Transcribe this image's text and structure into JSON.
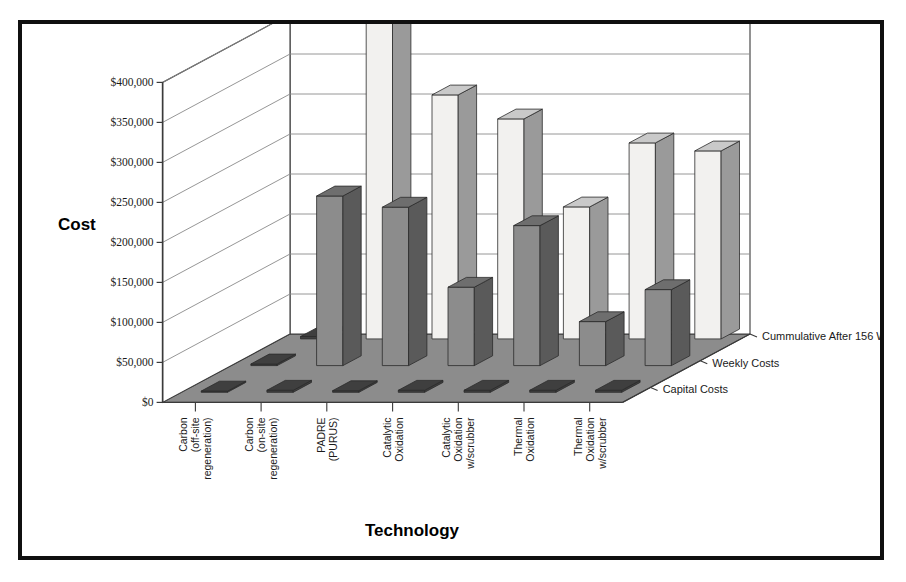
{
  "chart_data": {
    "type": "bar",
    "title": "",
    "subtitle": "",
    "xlabel": "Technology",
    "ylabel": "Cost",
    "ylim": [
      0,
      400000
    ],
    "ytick_labels": [
      "$0",
      "$50,000",
      "$100,000",
      "$150,000",
      "$200,000",
      "$250,000",
      "$300,000",
      "$350,000",
      "$400,000"
    ],
    "ytick_values": [
      0,
      50000,
      100000,
      150000,
      200000,
      250000,
      300000,
      350000,
      400000
    ],
    "grid": true,
    "legend_position": "depth-axis-right",
    "projection": "3d",
    "categories": [
      "Carbon\n(off-site\nregeneration)",
      "Carbon\n(on-site\nregeneration)",
      "PADRE\n(PURUS)",
      "Catalytic\nOxidation",
      "Catalytic\nOxidation\nw/scrubber",
      "Thermal\nOxidation",
      "Thermal\nOxidation\nw/scrubber"
    ],
    "categories_flat": [
      "Carbon (off-site regeneration)",
      "Carbon (on-site regeneration)",
      "PADRE (PURUS)",
      "Catalytic Oxidation",
      "Catalytic Oxidation w/scrubber",
      "Thermal Oxidation",
      "Thermal Oxidation w/scrubber"
    ],
    "series": [
      {
        "name": "Cummulative After 156 Weeks",
        "color": "#f2f1ef",
        "values": [
          3000,
          420000,
          305000,
          275000,
          165000,
          245000,
          235000
        ]
      },
      {
        "name": "Weekly Costs",
        "color": "#8c8c8c",
        "values": [
          2000,
          212000,
          198000,
          98000,
          175000,
          55000,
          95000
        ]
      },
      {
        "name": "Capital Costs",
        "color": "#4a4a4a",
        "values": [
          1500,
          2500,
          2000,
          2500,
          2500,
          2500,
          2500
        ]
      }
    ]
  },
  "colors": {
    "frame_border": "#101010",
    "floor": "#8c8c8c",
    "wall": "#ffffff",
    "gridline": "#8a8a8a",
    "axis_line": "#3a3a3a",
    "bar_light": "#f2f1ef",
    "bar_light_side": "#9a9a9a",
    "bar_light_top": "#c9c9c9",
    "bar_dark": "#8c8c8c",
    "bar_dark_side": "#5a5a5a",
    "bar_dark_top": "#6e6e6e",
    "plate": "#3f3f3f",
    "text": "#1a1a1a"
  }
}
